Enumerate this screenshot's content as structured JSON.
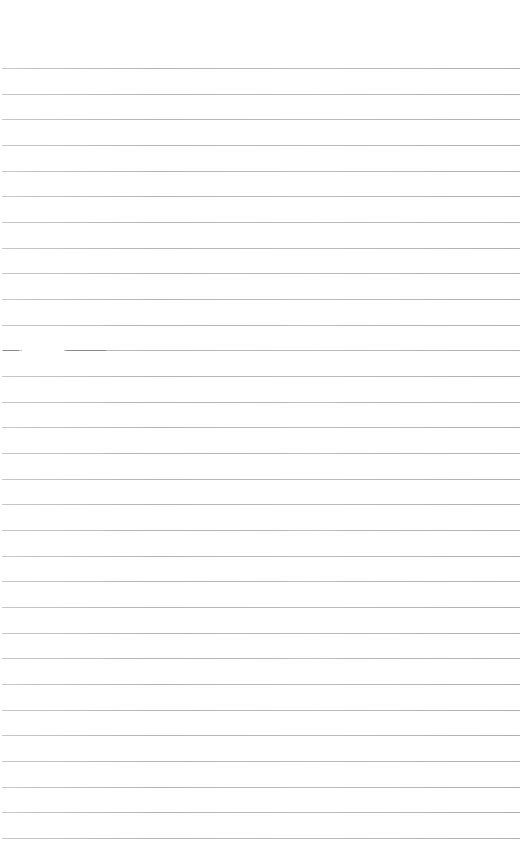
{
  "page": {
    "type": "ruled-paper",
    "background_color": "#ffffff",
    "rule_color": "#b8b8b8",
    "rule_count": 31,
    "first_rule_y": 68,
    "rule_spacing": 25.67,
    "rule_left": 2,
    "rule_width": 518,
    "text_content": ""
  }
}
